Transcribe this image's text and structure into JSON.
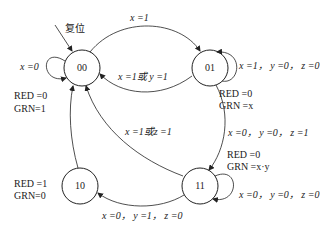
{
  "states": {
    "s00": {
      "label": "00",
      "output_red": "RED =0",
      "output_grn": "GRN=1"
    },
    "s01": {
      "label": "01",
      "output_red": "RED =0",
      "output_grn": "GRN =x"
    },
    "s11": {
      "label": "11",
      "output_red": "RED =0",
      "output_grn": "GRN =x·y"
    },
    "s10": {
      "label": "10",
      "output_red": "RED =1",
      "output_grn": "GRN=0"
    }
  },
  "reset_label": "复位",
  "transitions": {
    "t00_self": "x =0",
    "t00_01": "x =1",
    "t01_self": "x =1， y =0， z =0",
    "t01_00": "x =1或 y =1",
    "t01_11": "x =0， y =0， z =1",
    "t11_00": "x =1或z =1",
    "t11_self": "x =0， y =0， z =0",
    "t11_10": "x =0， y =1， z =0"
  }
}
